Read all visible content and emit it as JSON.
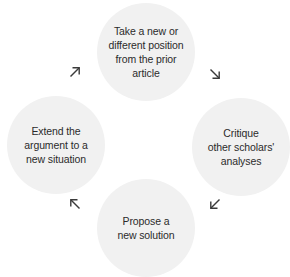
{
  "diagram": {
    "type": "cycle",
    "nodes": [
      {
        "id": "top",
        "label": "Take a new or\ndifferent position\nfrom the prior\narticle"
      },
      {
        "id": "right",
        "label": "Critique\nother scholars'\nanalyses"
      },
      {
        "id": "bottom",
        "label": "Propose a\nnew solution"
      },
      {
        "id": "left",
        "label": "Extend the\nargument to a\nnew situation"
      }
    ],
    "arrows": [
      {
        "id": "ne",
        "icon": "arrow-northeast-icon",
        "glyph": "↗"
      },
      {
        "id": "se",
        "icon": "arrow-southeast-icon",
        "glyph": "↘"
      },
      {
        "id": "sw",
        "icon": "arrow-southwest-icon",
        "glyph": "↙"
      },
      {
        "id": "nw",
        "icon": "arrow-northwest-icon",
        "glyph": "↖"
      }
    ],
    "colors": {
      "circle_fill": "#f1f1f1",
      "text": "#2b2b2b",
      "arrow": "#3a3a3a",
      "background": "#ffffff"
    }
  }
}
